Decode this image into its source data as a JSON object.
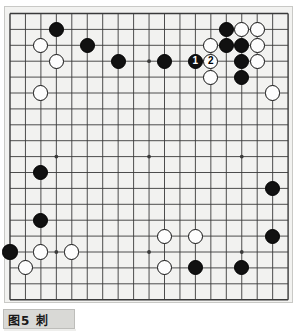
{
  "figure": {
    "caption_number": "图5",
    "caption_label": "刺",
    "caption_full": "图5  刺"
  },
  "board": {
    "size": 19,
    "columns": 19,
    "rows": 19,
    "background_color": "#f2f2f0",
    "line_color": "#3a3a3a",
    "border_color": "#c9c9c6",
    "star_points": [
      {
        "col": 4,
        "row": 4
      },
      {
        "col": 10,
        "row": 4
      },
      {
        "col": 16,
        "row": 4
      },
      {
        "col": 4,
        "row": 10
      },
      {
        "col": 10,
        "row": 10
      },
      {
        "col": 16,
        "row": 10
      },
      {
        "col": 4,
        "row": 16
      },
      {
        "col": 10,
        "row": 16
      },
      {
        "col": 16,
        "row": 16
      }
    ]
  },
  "chart_data": {
    "type": "diagram",
    "title": "图5  刺",
    "board_size": 19,
    "black_count": 21,
    "white_count": 16,
    "move_numbers": [
      {
        "number": "1",
        "color": "black",
        "col": 13,
        "row": 4
      },
      {
        "number": "2",
        "color": "white",
        "col": 14,
        "row": 4
      }
    ],
    "stones": [
      {
        "color": "black",
        "col": 4,
        "row": 2
      },
      {
        "color": "white",
        "col": 3,
        "row": 3
      },
      {
        "color": "black",
        "col": 6,
        "row": 3
      },
      {
        "color": "white",
        "col": 4,
        "row": 4
      },
      {
        "color": "black",
        "col": 8,
        "row": 4
      },
      {
        "color": "black",
        "col": 11,
        "row": 4
      },
      {
        "color": "white",
        "col": 3,
        "row": 6
      },
      {
        "color": "black",
        "col": 15,
        "row": 2
      },
      {
        "color": "white",
        "col": 16,
        "row": 2
      },
      {
        "color": "white",
        "col": 17,
        "row": 2
      },
      {
        "color": "white",
        "col": 14,
        "row": 3
      },
      {
        "color": "black",
        "col": 15,
        "row": 3
      },
      {
        "color": "black",
        "col": 16,
        "row": 3
      },
      {
        "color": "white",
        "col": 17,
        "row": 3
      },
      {
        "color": "black",
        "col": 13,
        "row": 4
      },
      {
        "color": "white",
        "col": 14,
        "row": 4
      },
      {
        "color": "black",
        "col": 16,
        "row": 4
      },
      {
        "color": "white",
        "col": 17,
        "row": 4
      },
      {
        "color": "white",
        "col": 14,
        "row": 5
      },
      {
        "color": "black",
        "col": 16,
        "row": 5
      },
      {
        "color": "white",
        "col": 18,
        "row": 6
      },
      {
        "color": "black",
        "col": 3,
        "row": 11
      },
      {
        "color": "black",
        "col": 18,
        "row": 12
      },
      {
        "color": "black",
        "col": 3,
        "row": 14
      },
      {
        "color": "white",
        "col": 11,
        "row": 15
      },
      {
        "color": "white",
        "col": 13,
        "row": 15
      },
      {
        "color": "black",
        "col": 18,
        "row": 15
      },
      {
        "color": "black",
        "col": 1,
        "row": 16
      },
      {
        "color": "white",
        "col": 3,
        "row": 16
      },
      {
        "color": "white",
        "col": 5,
        "row": 16
      },
      {
        "color": "white",
        "col": 2,
        "row": 17
      },
      {
        "color": "white",
        "col": 11,
        "row": 17
      },
      {
        "color": "black",
        "col": 13,
        "row": 17
      },
      {
        "color": "black",
        "col": 16,
        "row": 17
      }
    ],
    "xlabel": "",
    "ylabel": "",
    "grid": true,
    "legend": "none"
  }
}
